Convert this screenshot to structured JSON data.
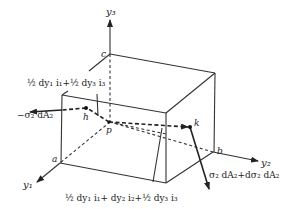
{
  "diagram": {
    "axes": {
      "y1": "y₁",
      "y2": "y₂",
      "y3": "y₃"
    },
    "vertices": {
      "a": "a",
      "b": "b",
      "c": "c",
      "p": "p",
      "h": "h",
      "k": "k"
    },
    "labels": {
      "top_offset": "½ dy₁ i₁+½ dy₃ i₃",
      "bottom_offset": "½ dy₁ i₁+ dy₂ i₂+½ dy₃ i₃",
      "left_force": "−σ₂ dA₂",
      "right_force": "σ₂ dA₂+dσ₂ dA₂"
    }
  }
}
